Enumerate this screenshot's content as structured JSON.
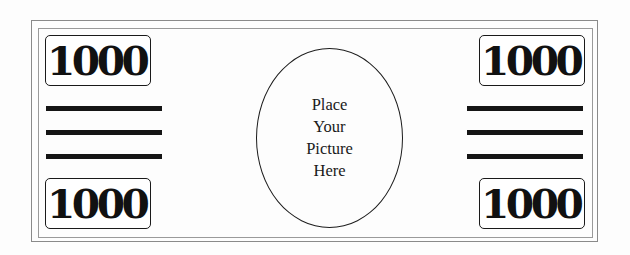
{
  "bill": {
    "denomination": "1000",
    "corners": {
      "top_left": "1000",
      "top_right": "1000",
      "bottom_left": "1000",
      "bottom_right": "1000"
    },
    "picture_placeholder": {
      "lines": [
        "Place",
        "Your",
        "Picture",
        "Here"
      ]
    },
    "decorative_bars": {
      "left_count": 3,
      "right_count": 3
    }
  },
  "colors": {
    "ink": "#111111",
    "border": "#8a8a8a",
    "background": "#fdfdfd"
  }
}
